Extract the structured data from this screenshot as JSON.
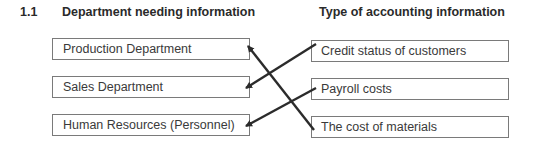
{
  "question": {
    "number": "1.1",
    "left_heading": "Department needing information",
    "right_heading": "Type of accounting information"
  },
  "departments": [
    {
      "label": "Production Department"
    },
    {
      "label": "Sales Department"
    },
    {
      "label": "Human Resources (Personnel)"
    }
  ],
  "information_types": [
    {
      "label": "Credit status of customers"
    },
    {
      "label": "Payroll costs"
    },
    {
      "label": "The cost of materials"
    }
  ],
  "connections": [
    {
      "from": "Credit status of customers",
      "to": "Sales Department"
    },
    {
      "from": "Payroll costs",
      "to": "Human Resources (Personnel)"
    },
    {
      "from": "The cost of materials",
      "to": "Production Department"
    }
  ],
  "colors": {
    "line": "#2b2b2b",
    "box_border": "#7a7a7a"
  }
}
